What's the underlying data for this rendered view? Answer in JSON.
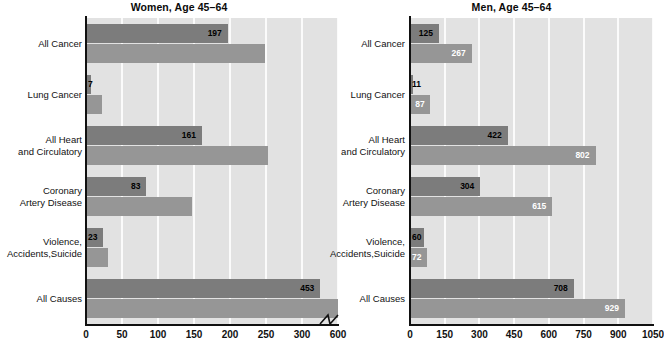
{
  "chart_data": [
    {
      "type": "bar",
      "title": "Women, Age 45–64",
      "orientation": "horizontal",
      "xlabel": "",
      "ylabel": "",
      "categories": [
        "All Cancer",
        "Lung Cancer",
        "All Heart\nand Circulatory",
        "Coronary\nArtery Disease",
        "Violence,\nAccidents,Suicide",
        "All Causes"
      ],
      "series": [
        {
          "name": "dark",
          "color": "#7c7c7c",
          "labeled": true,
          "values": [
            197,
            7,
            161,
            83,
            23,
            453
          ],
          "value_labels": [
            "197",
            "7",
            "161",
            "83",
            "23",
            "453"
          ]
        },
        {
          "name": "light",
          "color": "#969696",
          "labeled": false,
          "values": [
            248,
            22,
            253,
            147,
            31,
            600
          ],
          "value_labels": [
            "",
            "",
            "",
            "",
            "",
            ""
          ]
        }
      ],
      "xticks": [
        "0",
        "50",
        "100",
        "150",
        "200",
        "250",
        "300",
        "600"
      ],
      "xtick_values": [
        0,
        50,
        100,
        150,
        200,
        250,
        300,
        600
      ],
      "xlim": [
        0,
        600
      ],
      "axis_break": {
        "present": true,
        "between": [
          300,
          600
        ]
      },
      "grid": "vertical"
    },
    {
      "type": "bar",
      "title": "Men, Age 45–64",
      "orientation": "horizontal",
      "xlabel": "",
      "ylabel": "",
      "categories": [
        "All Cancer",
        "Lung Cancer",
        "All Heart\nand Circulatory",
        "Coronary\nArtery Disease",
        "Violence,\nAccidents,Suicide",
        "All Causes"
      ],
      "series": [
        {
          "name": "dark",
          "color": "#7c7c7c",
          "labeled": true,
          "values": [
            125,
            11,
            422,
            304,
            60,
            708
          ],
          "value_labels": [
            "125",
            "11",
            "422",
            "304",
            "60",
            "708"
          ]
        },
        {
          "name": "light",
          "color": "#969696",
          "labeled": true,
          "values": [
            267,
            87,
            802,
            615,
            72,
            929
          ],
          "value_labels": [
            "267",
            "87",
            "802",
            "615",
            "72",
            "929"
          ]
        }
      ],
      "xticks": [
        "0",
        "150",
        "300",
        "450",
        "600",
        "750",
        "900",
        "1050"
      ],
      "xtick_values": [
        0,
        150,
        300,
        450,
        600,
        750,
        900,
        1050
      ],
      "xlim": [
        0,
        1050
      ],
      "axis_break": {
        "present": false
      },
      "grid": "vertical"
    }
  ]
}
